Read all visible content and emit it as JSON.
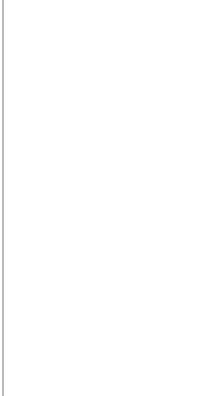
{
  "diagram": {
    "type": "probability-tree",
    "top_tree": {
      "root": {
        "x": 40,
        "y": 84
      },
      "leaves": [
        {
          "label": "W,W",
          "x": 183,
          "y": 17,
          "edge_label": "0,25",
          "lx": 118,
          "ly": 34,
          "rot": -27
        },
        {
          "label": "W,Z",
          "x": 181,
          "y": 63,
          "edge_label": "0,25",
          "lx": 120,
          "ly": 64,
          "rot": -8
        },
        {
          "label": "Z,W",
          "x": 182,
          "y": 107,
          "edge_label": "0,25",
          "lx": 120,
          "ly": 92,
          "rot": 8
        },
        {
          "label": "Z,Z",
          "x": 182,
          "y": 152,
          "edge_label": "0,25",
          "lx": 118,
          "ly": 120,
          "rot": 24
        }
      ]
    },
    "bottom_tree": {
      "root": {
        "x": 9,
        "y": 297
      },
      "branches": [
        {
          "label": "W",
          "x": 96,
          "y": 252,
          "edge_label": "0,5",
          "lx": 42,
          "ly": 265,
          "rot": -27,
          "children": [
            {
              "label": "W",
              "x": 181,
              "y": 225,
              "edge_label": "0,5",
              "lx": 135,
              "ly": 233,
              "rot": -18
            },
            {
              "label": "Z",
              "x": 181,
              "y": 273,
              "edge_label": "0,5",
              "lx": 137,
              "ly": 279,
              "rot": 18
            }
          ]
        },
        {
          "label": "Z",
          "x": 96,
          "y": 342,
          "edge_label": "0,5",
          "lx": 42,
          "ly": 338,
          "rot": 27,
          "children": [
            {
              "label": "W",
              "x": 181,
              "y": 319,
              "edge_label": "0,5",
              "lx": 135,
              "ly": 323,
              "rot": -18
            },
            {
              "label": "Z",
              "x": 181,
              "y": 366,
              "edge_label": "0,5",
              "lx": 137,
              "ly": 370,
              "rot": 18
            }
          ]
        }
      ]
    },
    "colors": {
      "line": "#3a3a3a",
      "text": "#333333",
      "border": "#b9b9b9",
      "background": "#ffffff"
    }
  }
}
